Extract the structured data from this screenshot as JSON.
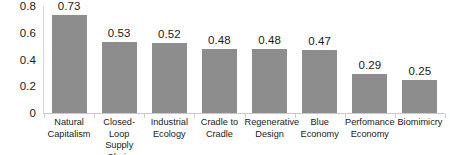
{
  "chart_data": {
    "type": "bar",
    "title": "",
    "subtitle": "",
    "xlabel": "",
    "ylabel": "",
    "categories": [
      "Natural Capitalism",
      "Closed-Loop Supply Chain",
      "Industrial Ecology",
      "Cradle to Cradle",
      "Regenerative Design",
      "Blue Economy",
      "Perfomance Economy",
      "Biomimicry"
    ],
    "values": [
      0.73,
      0.53,
      0.52,
      0.48,
      0.48,
      0.47,
      0.29,
      0.25
    ],
    "value_labels": [
      "0.73",
      "0.53",
      "0.52",
      "0.48",
      "0.48",
      "0.47",
      "0.29",
      "0.25"
    ],
    "ylim": [
      0,
      0.8
    ],
    "y_ticks": [
      0,
      0.2,
      0.4,
      0.6,
      0.8
    ],
    "y_tick_labels": [
      "0",
      "0.2",
      "0.4",
      "0.6",
      "0.8"
    ],
    "grid": false,
    "legend": false,
    "legend_position": "none",
    "bar_color": "#8d8d8d",
    "axis_color": "#c9c9c9",
    "text_color": "#1a1a1a",
    "background_color": "#ffffff"
  }
}
